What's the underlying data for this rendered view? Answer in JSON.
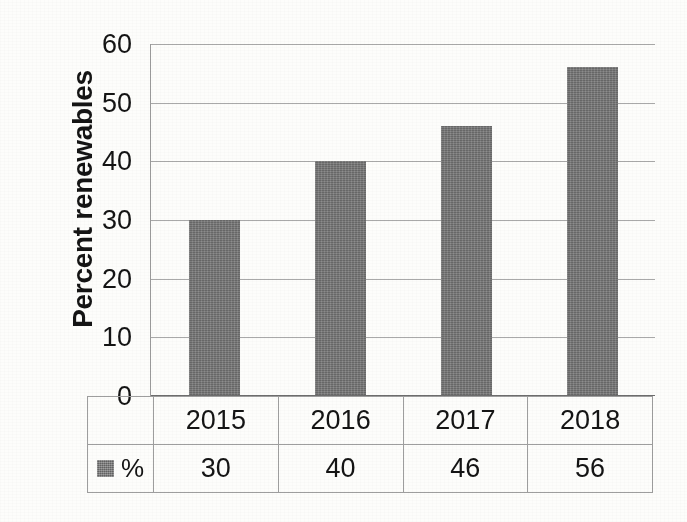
{
  "chart_data": {
    "type": "bar",
    "title": "",
    "subtitle": "",
    "xlabel": "",
    "ylabel": "Percent renewables",
    "categories": [
      "2015",
      "2016",
      "2017",
      "2018"
    ],
    "values": [
      30,
      40,
      46,
      56
    ],
    "series": [
      {
        "name": "%",
        "values": [
          30,
          40,
          46,
          56
        ]
      }
    ],
    "ylim": [
      0,
      60
    ],
    "ytick_labels": [
      "60",
      "50",
      "40",
      "30",
      "20",
      "10",
      "0"
    ],
    "ytick_values": [
      60,
      50,
      40,
      30,
      20,
      10,
      0
    ],
    "grid": true,
    "legend_position": "data-table",
    "bar_color": "#737373",
    "gridline_color": "#a9a9a9",
    "axis_color": "#6e6e6e",
    "background_color": "#fdfdfb"
  },
  "data_table": {
    "legend_label": "%",
    "legend_swatch_color": "#767676",
    "year_row": [
      "2015",
      "2016",
      "2017",
      "2018"
    ],
    "value_row": [
      "30",
      "40",
      "46",
      "56"
    ]
  }
}
